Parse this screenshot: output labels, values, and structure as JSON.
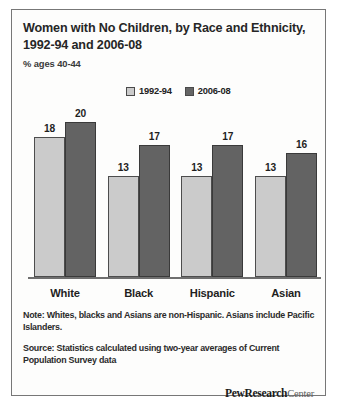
{
  "header": {
    "title": "Women with No Children, by Race and Ethnicity, 1992-94 and 2006-08",
    "subtitle": "% ages 40-44"
  },
  "legend": {
    "items": [
      {
        "label": "1992-94",
        "color": "#cbcbcb"
      },
      {
        "label": "2006-08",
        "color": "#636363"
      }
    ]
  },
  "notes": {
    "note": "Note: Whites, blacks and Asians are non-Hispanic. Asians include Pacific Islanders.",
    "source": "Source: Statistics calculated using two-year averages of Current Population Survey data"
  },
  "brand": {
    "bold": "PewResearch",
    "light": "Center"
  },
  "chart_data": {
    "type": "bar",
    "title": "Women with No Children, by Race and Ethnicity, 1992-94 and 2006-08",
    "subtitle": "% ages 40-44",
    "xlabel": "",
    "ylabel": "% ages 40-44",
    "ylim": [
      0,
      22
    ],
    "grid": false,
    "legend_position": "top-center",
    "categories": [
      "White",
      "Black",
      "Hispanic",
      "Asian"
    ],
    "series": [
      {
        "name": "1992-94",
        "color": "#cbcbcb",
        "values": [
          18,
          13,
          13,
          13
        ]
      },
      {
        "name": "2006-08",
        "color": "#636363",
        "values": [
          20,
          17,
          17,
          16
        ]
      }
    ]
  }
}
